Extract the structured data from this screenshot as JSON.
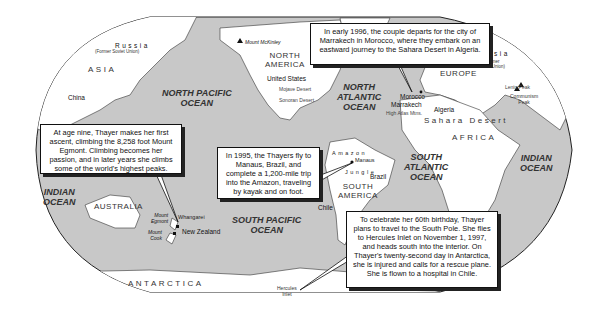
{
  "map": {
    "oceans": {
      "north_pacific": "NORTH PACIFIC\nOCEAN",
      "north_atlantic": "NORTH\nATLANTIC\nOCEAN",
      "south_atlantic": "SOUTH\nATLANTIC\nOCEAN",
      "south_pacific": "SOUTH PACIFIC\nOCEAN",
      "indian_west": "INDIAN\nOCEAN",
      "indian_east": "INDIAN\nOCEAN"
    },
    "continents": {
      "asia": "ASIA",
      "north_america": "NORTH\nAMERICA",
      "europe": "EUROPE",
      "africa": "AFRICA",
      "south_america": "SOUTH\nAMERICA",
      "australia": "AUSTRALIA",
      "antarctica": "ANTARCTICA"
    },
    "countries": {
      "russia_west": "Russia",
      "russia_west_sub": "(Former Soviet Union)",
      "russia_east": "Russia",
      "russia_east_sub": "(Former\nSoviet Union)",
      "china": "China",
      "united_states": "United States",
      "morocco": "Morocco",
      "algeria": "Algeria",
      "brazil": "Brazil",
      "chile": "Chile",
      "new_zealand": "New Zealand"
    },
    "places": {
      "mount_mckinley": "Mount McKinley",
      "mojave_desert": "Mojave Desert",
      "sonoran_desert": "Sonoran Desert",
      "marrakech": "Marrakech",
      "high_atlas": "High Atlas Mtns.",
      "sahara": "Sahara Desert",
      "lenin_peak": "Lenin Peak",
      "communism_peak": "Communism\nPeak",
      "manaus": "Manaus",
      "amazon": "Amazon",
      "jungle": "Jungle",
      "whangarei": "Whangarei",
      "mount_egmont": "Mount\nEgmont",
      "mount_cook": "Mount\nCook",
      "hercules_inlet": "Hercules\nInlet"
    },
    "callouts": {
      "marrakech": "In early 1996, the couple departs for the city of Marrakech in Morocco, where they embark on an eastward journey to the Sahara Desert in Algeria.",
      "egmont": "At age nine, Thayer makes her first ascent, climbing the 8,258 foot Mount Egmont. Climbing becomes her passion, and in later years she climbs some of the world's highest peaks.",
      "amazon": "In 1995, the Thayers fly to Manaus, Brazil, and complete a 1,200-mile trip into the Amazon, traveling by kayak and on foot.",
      "antarctica": "To celebrate her 60th birthday, Thayer plans to travel to the South Pole. She flies to Hercules Inlet on November 1, 1997, and heads south into the interior. On Thayer's twenty-second day in Antarctica, she is injured and calls for a rescue plane. She is flown to a hospital in Chile."
    },
    "colors": {
      "ocean": "#c8c8c8",
      "land": "#ffffff",
      "outline": "#222222"
    }
  }
}
